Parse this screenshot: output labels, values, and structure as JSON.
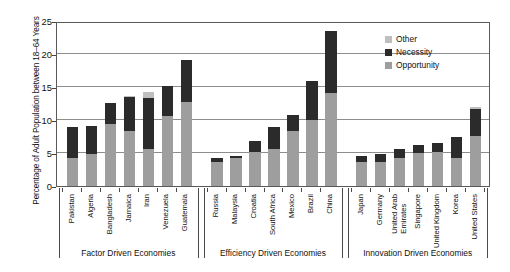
{
  "chart_data": {
    "type": "bar",
    "stacked": true,
    "title": "",
    "xlabel": "",
    "ylabel": "Percentage of Adult Population between 18–64 Years",
    "ylim": [
      0,
      25
    ],
    "yticks": [
      0,
      5,
      10,
      15,
      20,
      25
    ],
    "grid": true,
    "legend_position": "top-right",
    "legend": [
      "Other",
      "Necessity",
      "Opportunity"
    ],
    "colors": {
      "Other": "#bfbfbf",
      "Necessity": "#2b2b2b",
      "Opportunity": "#9e9e9e"
    },
    "categories": [
      "Pakistan",
      "Algeria",
      "Bangladesh",
      "Jamaica",
      "Iran",
      "Venezuela",
      "Guatemala",
      "Russia",
      "Malaysia",
      "Croatia",
      "South Africa",
      "Mexico",
      "Brazil",
      "China",
      "Japan",
      "Germany",
      "United Arab Emirates",
      "Singapore",
      "United Kingdom",
      "Korea",
      "United States"
    ],
    "series": [
      {
        "name": "Opportunity",
        "values": [
          4.2,
          4.9,
          9.4,
          8.3,
          5.6,
          10.6,
          12.7,
          3.6,
          4.2,
          5.1,
          5.6,
          8.3,
          10.0,
          14.1,
          3.6,
          3.7,
          4.2,
          5.0,
          5.1,
          4.2,
          7.6
        ]
      },
      {
        "name": "Necessity",
        "values": [
          4.8,
          4.2,
          3.2,
          5.2,
          7.8,
          4.6,
          6.4,
          0.6,
          0.4,
          1.7,
          3.3,
          2.4,
          5.9,
          9.4,
          0.9,
          1.2,
          1.4,
          1.2,
          1.4,
          3.2,
          4.0
        ]
      },
      {
        "name": "Other",
        "values": [
          0.0,
          0.0,
          0.0,
          0.2,
          0.9,
          0.0,
          0.0,
          0.0,
          0.0,
          0.0,
          0.0,
          0.0,
          0.0,
          0.0,
          0.0,
          0.0,
          0.0,
          0.0,
          0.0,
          0.0,
          0.3
        ]
      }
    ],
    "totals": [
      9.0,
      9.1,
      12.6,
      13.7,
      14.3,
      15.2,
      19.1,
      4.2,
      4.6,
      6.8,
      8.9,
      10.7,
      15.9,
      23.5,
      4.5,
      4.9,
      5.6,
      6.2,
      6.5,
      7.4,
      11.9
    ],
    "groups": [
      {
        "label": "Factor Driven Economies",
        "start": 0,
        "end": 6
      },
      {
        "label": "Efficiency Driven Economies",
        "start": 7,
        "end": 13
      },
      {
        "label": "Innovation Driven Economies",
        "start": 14,
        "end": 20
      }
    ]
  }
}
